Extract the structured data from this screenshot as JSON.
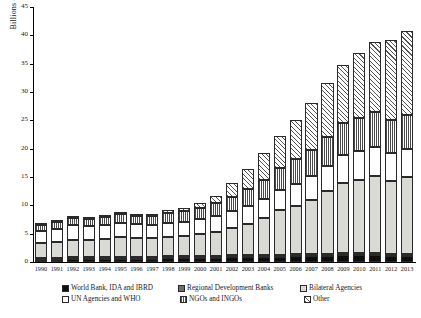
{
  "chart_data": {
    "type": "bar",
    "stacked": true,
    "title": "",
    "xlabel": "",
    "ylabel": "Billions of 2014 US Dollars",
    "ylim": [
      0,
      45
    ],
    "ytick_step": 5,
    "yticks": [
      "0",
      "5",
      "10",
      "15",
      "20",
      "25",
      "30",
      "35",
      "40",
      "45"
    ],
    "grid": false,
    "legend_position": "bottom",
    "categories": [
      "1990",
      "1991",
      "1992",
      "1993",
      "1994",
      "1995",
      "1996",
      "1997",
      "1998",
      "1999",
      "2000",
      "2001",
      "2002",
      "2003",
      "2004",
      "2005",
      "2006",
      "2007",
      "2008",
      "2009",
      "2010",
      "2011",
      "2012",
      "2013"
    ],
    "series": [
      {
        "name": "World Bank, IDA and IBRD",
        "pattern": "solid-black",
        "values": [
          0.3,
          0.4,
          0.5,
          0.5,
          0.5,
          0.6,
          0.6,
          0.6,
          0.7,
          0.7,
          0.7,
          0.7,
          0.8,
          0.8,
          0.8,
          0.9,
          1.0,
          1.0,
          1.1,
          1.2,
          1.3,
          1.3,
          1.1,
          1.1
        ]
      },
      {
        "name": "Regional Development Banks",
        "pattern": "solid-gray",
        "values": [
          0.1,
          0.1,
          0.1,
          0.1,
          0.1,
          0.1,
          0.1,
          0.1,
          0.2,
          0.2,
          0.2,
          0.2,
          0.2,
          0.2,
          0.2,
          0.2,
          0.3,
          0.3,
          0.3,
          0.3,
          0.3,
          0.3,
          0.3,
          0.3
        ]
      },
      {
        "name": "Bilateral Agencies",
        "pattern": "light-gray",
        "values": [
          2.6,
          2.8,
          3.1,
          3.0,
          3.2,
          3.4,
          3.2,
          3.2,
          3.4,
          3.6,
          3.9,
          4.2,
          4.9,
          5.6,
          6.6,
          7.9,
          8.6,
          9.6,
          11.0,
          12.4,
          12.8,
          13.5,
          12.9,
          13.5
        ]
      },
      {
        "name": "UN Agencies and WHO",
        "pattern": "white",
        "values": [
          2.2,
          2.3,
          2.5,
          2.5,
          2.5,
          2.6,
          2.5,
          2.4,
          2.5,
          2.5,
          2.6,
          2.8,
          2.9,
          3.2,
          3.4,
          3.6,
          3.9,
          4.2,
          4.5,
          4.9,
          5.1,
          5.2,
          4.9,
          5.0
        ]
      },
      {
        "name": "NGOs and INGOs",
        "pattern": "vertical-stripes",
        "values": [
          1.1,
          1.2,
          1.3,
          1.3,
          1.4,
          1.5,
          1.5,
          1.6,
          1.7,
          1.8,
          2.0,
          2.3,
          2.6,
          3.0,
          3.4,
          3.9,
          4.3,
          4.7,
          5.2,
          5.6,
          5.9,
          6.1,
          5.9,
          6.0
        ]
      },
      {
        "name": "Other",
        "pattern": "diagonal-hatch",
        "values": [
          0.2,
          0.2,
          0.2,
          0.2,
          0.3,
          0.3,
          0.3,
          0.4,
          0.5,
          0.6,
          0.8,
          1.3,
          2.4,
          3.5,
          4.6,
          5.6,
          7.0,
          8.2,
          9.4,
          10.3,
          11.4,
          12.3,
          14.0,
          14.9
        ]
      }
    ],
    "totals": [
      6.5,
      7.0,
      7.7,
      7.6,
      8.0,
      8.5,
      8.2,
      8.3,
      9.0,
      9.4,
      10.2,
      11.5,
      13.8,
      16.3,
      19.0,
      22.1,
      25.1,
      28.0,
      31.5,
      34.7,
      36.8,
      38.7,
      39.1,
      40.8
    ]
  },
  "legend": {
    "items": [
      {
        "label": "World Bank, IDA and IBRD",
        "swatch": "solid-black-swatch"
      },
      {
        "label": "Regional Development Banks",
        "swatch": "solid-gray-swatch"
      },
      {
        "label": "Bilateral Agencies",
        "swatch": "light-gray-swatch"
      },
      {
        "label": "UN Agencies and WHO",
        "swatch": "white-swatch"
      },
      {
        "label": "NGOs and INGOs",
        "swatch": "vertical-stripes-swatch"
      },
      {
        "label": "Other",
        "swatch": "diagonal-hatch-swatch"
      }
    ]
  },
  "colors": {
    "world_bank": "#0d0d0d",
    "regional_banks": "#6e6e6e",
    "bilateral": "#d9d9d6",
    "un_who": "#ffffff",
    "ngos": "#4a4a4a",
    "other": "#555555",
    "axis": "#000000"
  }
}
